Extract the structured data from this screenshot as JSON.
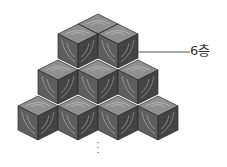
{
  "diagram": {
    "label": "6층",
    "continuation": "⋮",
    "rows": [
      {
        "name": "top",
        "cubes": 2
      },
      {
        "name": "middle",
        "cubes": 3
      },
      {
        "name": "bottom",
        "cubes": 4
      }
    ],
    "colors": {
      "top_face": "#8f8f8f",
      "left_face": "#5e5e5e",
      "right_face": "#444444",
      "edge": "#2a2a2a",
      "grain": "#c8c8c8",
      "leader_line": "#555555"
    }
  }
}
